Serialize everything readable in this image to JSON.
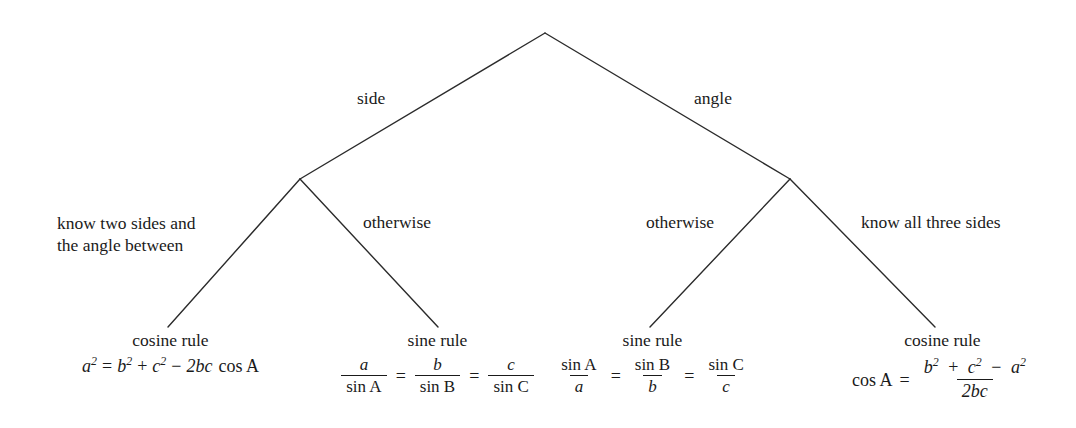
{
  "diagram": {
    "line_color": "#1a1a1a",
    "background_color": "#ffffff",
    "root": {
      "name": "root-node",
      "x": 545,
      "y": 33
    },
    "nodes": [
      {
        "name": "left-branch-node",
        "x": 300,
        "y": 179
      },
      {
        "name": "right-branch-node",
        "x": 790,
        "y": 179
      }
    ],
    "edges": [
      {
        "name": "root-to-left",
        "from": [
          545,
          33
        ],
        "to": [
          300,
          179
        ],
        "label": "side"
      },
      {
        "name": "root-to-right",
        "from": [
          545,
          33
        ],
        "to": [
          790,
          179
        ],
        "label": "angle"
      },
      {
        "name": "left-to-leaf1",
        "from": [
          300,
          179
        ],
        "to": [
          168,
          327
        ],
        "label": "know two sides and the angle between"
      },
      {
        "name": "left-to-leaf2",
        "from": [
          300,
          179
        ],
        "to": [
          438,
          327
        ],
        "label": "otherwise"
      },
      {
        "name": "right-to-leaf3",
        "from": [
          790,
          179
        ],
        "to": [
          650,
          327
        ],
        "label": "otherwise"
      },
      {
        "name": "right-to-leaf4",
        "from": [
          790,
          179
        ],
        "to": [
          935,
          327
        ],
        "label": "know all three sides"
      }
    ],
    "edge_labels": {
      "side": "side",
      "angle": "angle",
      "know_two_sides_line1": "know two sides and",
      "know_two_sides_line2": "the angle between",
      "otherwise_left": "otherwise",
      "otherwise_right": "otherwise",
      "know_all_three_sides": "know all three sides"
    },
    "leaves": [
      {
        "name": "leaf-cosine-rule-left",
        "title": "cosine rule",
        "formula": "a² = b² + c² − 2bc cos A",
        "parts": {
          "lhs_var": "a",
          "lhs_exp": "2",
          "equals": "=",
          "t1_var": "b",
          "t1_exp": "2",
          "plus": "+",
          "t2_var": "c",
          "t2_exp": "2",
          "minus": "−",
          "t3": "2bc",
          "cos": "cos A"
        }
      },
      {
        "name": "leaf-sine-rule-sides-over-sines",
        "title": "sine rule",
        "formula": "a / sin A = b / sin B = c / sin C",
        "parts": {
          "f1_num": "a",
          "f1_den": "sin A",
          "eq1": "=",
          "f2_num": "b",
          "f2_den": "sin B",
          "eq2": "=",
          "f3_num": "c",
          "f3_den": "sin C"
        }
      },
      {
        "name": "leaf-sine-rule-sines-over-sides",
        "title": "sine rule",
        "formula": "sin A / a = sin B / b = sin C / c",
        "parts": {
          "f1_num": "sin A",
          "f1_den": "a",
          "eq1": "=",
          "f2_num": "sin B",
          "f2_den": "b",
          "eq2": "=",
          "f3_num": "sin C",
          "f3_den": "c"
        }
      },
      {
        "name": "leaf-cosine-rule-right",
        "title": "cosine rule",
        "formula": "cos A = (b² + c² − a²) / 2bc",
        "parts": {
          "lhs": "cos A",
          "equals": "=",
          "num_t1_var": "b",
          "num_t1_exp": "2",
          "plus": "+",
          "num_t2_var": "c",
          "num_t2_exp": "2",
          "minus": "−",
          "num_t3_var": "a",
          "num_t3_exp": "2",
          "den": "2bc"
        }
      }
    ]
  }
}
